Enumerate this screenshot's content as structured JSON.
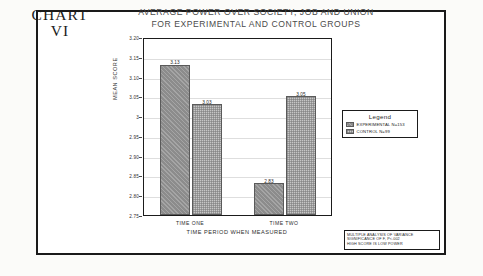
{
  "figure": {
    "number_line1": "CHART",
    "number_line2": "VI",
    "title_line1": "AVERAGE POWER OVER SOCIETY, JOB AND UNION",
    "title_line2": "FOR EXPERIMENTAL AND CONTROL GROUPS"
  },
  "legend": {
    "title": "Legend",
    "entries": [
      {
        "label": "EXPERIMENTAL N=153",
        "swatch": "exp"
      },
      {
        "label": "CONTROL N=99",
        "swatch": "ctrl"
      }
    ]
  },
  "footnote": {
    "line1": "MULTIPLE ANALYSIS OF VARIANCE",
    "line2": "SIGNIFICANCE OF F, P<.002",
    "line3": "HIGH SCORE IS LOW POWER"
  },
  "chart_data": {
    "type": "bar",
    "title": "AVERAGE POWER OVER SOCIETY, JOB AND UNION FOR EXPERIMENTAL AND CONTROL GROUPS",
    "xlabel": "TIME PERIOD WHEN MEASURED",
    "ylabel": "MEAN SCORE",
    "categories": [
      "TIME ONE",
      "TIME TWO"
    ],
    "series": [
      {
        "name": "EXPERIMENTAL N=153",
        "values": [
          3.13,
          2.83
        ]
      },
      {
        "name": "CONTROL N=99",
        "values": [
          3.03,
          3.05
        ]
      }
    ],
    "ylim": [
      2.75,
      3.2
    ],
    "yticks": [
      3.2,
      3.15,
      3.1,
      3.05,
      3,
      2.95,
      2.9,
      2.85,
      2.8,
      2.75
    ],
    "ytick_labels": [
      "3.20",
      "3.15",
      "3.10",
      "3.05",
      "3",
      "2.95",
      "2.90",
      "2.85",
      "2.80",
      "2.75"
    ],
    "bar_labels": [
      "3.13",
      "3.03",
      "2.83",
      "3.05"
    ],
    "grid": true,
    "legend_position": "right-outside",
    "colors": {
      "experimental": "#8c8c8c",
      "control": "#c6c6c6",
      "axis": "#1b1b1b",
      "grid": "#dedede"
    }
  }
}
